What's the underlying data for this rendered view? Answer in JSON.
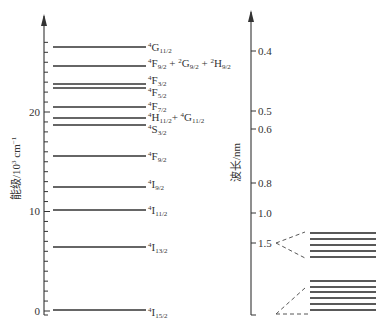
{
  "left_axis": {
    "label": "能级/10³ cm⁻¹",
    "label_main": "能级/10",
    "label_sup": "3",
    "label_unit": " cm",
    "label_unit_sup": "−1",
    "ticks": [
      {
        "value": "0",
        "y": 311
      },
      {
        "value": "10",
        "y": 211
      },
      {
        "value": "20",
        "y": 112
      }
    ]
  },
  "right_axis": {
    "label": "波长/nm",
    "ticks": [
      {
        "value": "0.4",
        "y": 51
      },
      {
        "value": "0.5",
        "y": 111
      },
      {
        "value": "0.6",
        "y": 129
      },
      {
        "value": "0.8",
        "y": 183
      },
      {
        "value": "1.0",
        "y": 213
      },
      {
        "value": "1.5",
        "y": 243
      }
    ]
  },
  "levels": [
    {
      "name": "4G11/2",
      "y": 47
    },
    {
      "name": "4F9/2 + 2G9/2 + 2H9/2",
      "y": 66
    },
    {
      "name": "4F3/2",
      "y": 84
    },
    {
      "name": "4F5/2",
      "y": 88
    },
    {
      "name": "4F7/2",
      "y": 107
    },
    {
      "name": "4H11/2 + 4G11/2",
      "y": 118
    },
    {
      "name": "4S3/2",
      "y": 125
    },
    {
      "name": "4F9/2",
      "y": 156
    },
    {
      "name": "4I9/2",
      "y": 187
    },
    {
      "name": "4I11/2",
      "y": 210
    },
    {
      "name": "4I13/2",
      "y": 247
    },
    {
      "name": "4I15/2",
      "y": 310
    }
  ],
  "split_groups": [
    {
      "label": "4I13/2 Stark splitting",
      "lines_y": [
        233,
        239,
        245,
        251,
        257
      ]
    },
    {
      "label": "4I15/2 Stark splitting",
      "lines_y": [
        281,
        287,
        292,
        298,
        304,
        310
      ]
    }
  ]
}
